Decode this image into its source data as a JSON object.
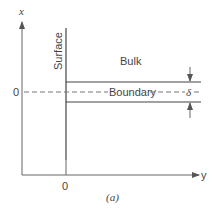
{
  "figure": {
    "caption": "(a)",
    "axes": {
      "vertical_label": "x",
      "horizontal_label": "y",
      "vertical_origin_label": "0",
      "horizontal_origin_label": "0"
    },
    "regions": {
      "surface_label": "Surface",
      "bulk_label": "Bulk",
      "boundary_label": "Boundary",
      "thickness_label": "δ"
    },
    "colors": {
      "line": "#555555",
      "background": "#ffffff"
    }
  }
}
